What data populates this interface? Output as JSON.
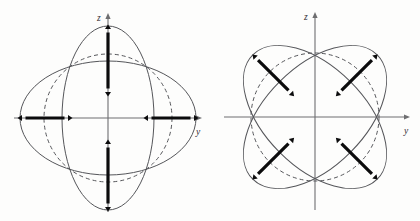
{
  "figure": {
    "title": "",
    "background_color": "#fdfdfc",
    "curve_color": "#55565a",
    "axis_color": "#6e6e70",
    "vector_color": "#0b0b0c",
    "panels": [
      {
        "id": "left-panel",
        "name": "axial-mode-diagram",
        "center": {
          "x": 108,
          "y": 118
        },
        "axes": {
          "horizontal": {
            "label": "y",
            "label_x": 196,
            "label_y": 135,
            "x1": 14,
            "x2": 201,
            "y": 118
          },
          "vertical": {
            "label": "z",
            "label_x": 97,
            "label_y": 21,
            "y1": 14,
            "y2": 212,
            "x": 108
          }
        },
        "curves": [
          {
            "name": "prolate-ellipse",
            "kind": "ellipse",
            "rx": 46,
            "ry": 92,
            "rotation": 0,
            "style": "solid"
          },
          {
            "name": "oblate-ellipse",
            "kind": "ellipse",
            "rx": 88,
            "ry": 57,
            "rotation": 0,
            "style": "solid"
          },
          {
            "name": "reference-circle",
            "kind": "circle",
            "rx": 64,
            "ry": 64,
            "rotation": 0,
            "style": "dashed"
          }
        ],
        "vectors": [
          {
            "name": "vector-up",
            "angle_deg": 90,
            "inner": 26,
            "outer": 89
          },
          {
            "name": "vector-down",
            "angle_deg": 270,
            "inner": 26,
            "outer": 89
          },
          {
            "name": "vector-left",
            "angle_deg": 180,
            "inner": 40,
            "outer": 86
          },
          {
            "name": "vector-right",
            "angle_deg": 0,
            "inner": 40,
            "outer": 86
          }
        ]
      },
      {
        "id": "right-panel",
        "name": "diagonal-mode-diagram",
        "center": {
          "x": 315,
          "y": 117
        },
        "axes": {
          "horizontal": {
            "label": "y",
            "label_x": 404,
            "label_y": 134,
            "x1": 224,
            "x2": 409,
            "y": 117
          },
          "vertical": {
            "label": "z",
            "label_x": 304,
            "label_y": 20,
            "y1": 13,
            "y2": 210,
            "x": 315
          }
        },
        "curves": [
          {
            "name": "ellipse-plus-45",
            "kind": "ellipse",
            "rx": 50,
            "ry": 88,
            "rotation": 45,
            "style": "solid"
          },
          {
            "name": "ellipse-minus-45",
            "kind": "ellipse",
            "rx": 50,
            "ry": 88,
            "rotation": -45,
            "style": "solid"
          },
          {
            "name": "reference-circle",
            "kind": "circle",
            "rx": 64,
            "ry": 64,
            "rotation": 0,
            "style": "dashed"
          }
        ],
        "vectors": [
          {
            "name": "vector-upper-left",
            "angle_deg": 135,
            "inner": 34,
            "outer": 84
          },
          {
            "name": "vector-upper-right",
            "angle_deg": 45,
            "inner": 34,
            "outer": 84
          },
          {
            "name": "vector-lower-left",
            "angle_deg": 225,
            "inner": 34,
            "outer": 84
          },
          {
            "name": "vector-lower-right",
            "angle_deg": 315,
            "inner": 34,
            "outer": 84
          }
        ]
      }
    ]
  }
}
